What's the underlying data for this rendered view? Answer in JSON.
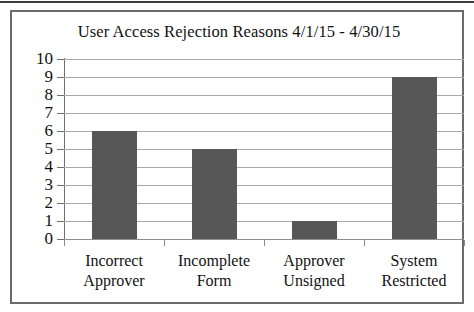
{
  "chart_data": {
    "type": "bar",
    "title": "User Access Rejection Reasons 4/1/15 - 4/30/15",
    "xlabel": "",
    "ylabel": "",
    "categories": [
      "Incorrect Approver",
      "Incomplete Form",
      "Approver Unsigned",
      "System Restricted"
    ],
    "category_lines": [
      [
        "Incorrect",
        "Approver"
      ],
      [
        "Incomplete",
        "Form"
      ],
      [
        "Approver",
        "Unsigned"
      ],
      [
        "System",
        "Restricted"
      ]
    ],
    "values": [
      6,
      5,
      1,
      9
    ],
    "ylim": [
      0,
      10
    ],
    "ytick_step": 1,
    "yticks": [
      "10",
      "9",
      "8",
      "7",
      "6",
      "5",
      "4",
      "3",
      "2",
      "1",
      "0"
    ],
    "grid": true,
    "legend": "none",
    "bar_color": "#575757",
    "gridline_color": "#a8a8a8",
    "axis_color": "#6f6f6f",
    "frame_color": "#6b6b6b",
    "background_color": "#ffffff",
    "text_color": "#111111"
  }
}
